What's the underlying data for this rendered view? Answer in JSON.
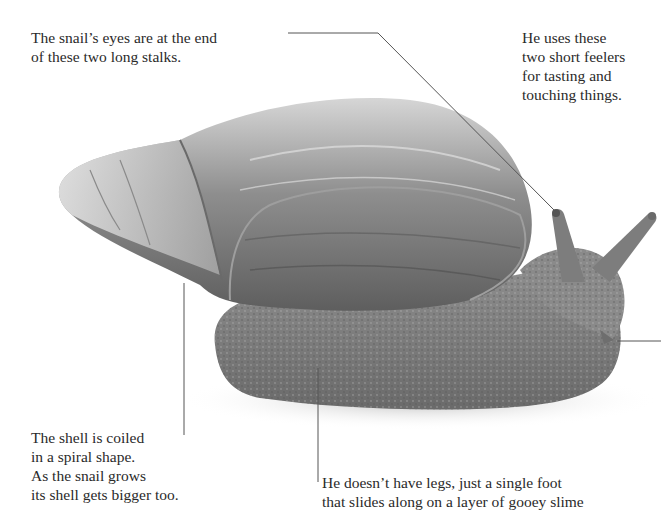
{
  "captions": {
    "eyes": [
      "The snail’s eyes are at the end",
      "of these two long stalks."
    ],
    "feelers": [
      "He uses these",
      "two short feelers",
      "for tasting and",
      "touching things."
    ],
    "shell": [
      "The shell is coiled",
      "in a spiral shape.",
      "As the snail grows",
      "its shell gets bigger too."
    ],
    "foot": [
      "He doesn’t have legs, just a single foot",
      "that slides along on a layer of gooey slime"
    ]
  },
  "image": {
    "subject": "snail-photo",
    "colors": {
      "background": "#ffffff",
      "leader_line": "#555555",
      "shell_dark": "#6e6e6e",
      "shell_light": "#c9c9c9",
      "body": "#8a8a8a"
    }
  }
}
